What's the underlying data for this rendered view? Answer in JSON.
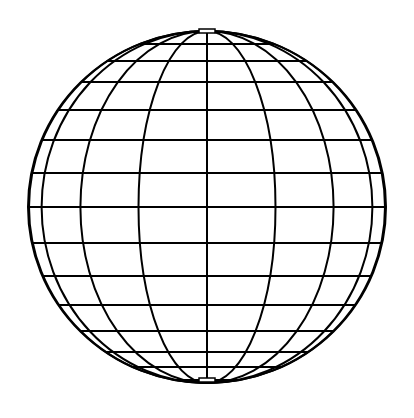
{
  "diagram": {
    "title": "Wireframe globe",
    "type": "sphere-graticule",
    "canvas": {
      "width": 414,
      "height": 418,
      "background": "#ffffff"
    },
    "stroke_color": "#000000",
    "stroke_width": 2,
    "globe": {
      "cx": 207,
      "cy": 207,
      "rx": 179,
      "ry": 176
    },
    "meridians_deg": [
      0,
      22.5,
      45,
      67.5,
      84
    ],
    "parallels_y": [
      32,
      44,
      61,
      82,
      110,
      140,
      173,
      207,
      243,
      276,
      305,
      331,
      352,
      367,
      380
    ],
    "pole_caps": [
      {
        "name": "north-pole-cap",
        "x": 199,
        "y": 29,
        "w": 16,
        "h": 4
      },
      {
        "name": "south-pole-cap",
        "x": 199,
        "y": 378,
        "w": 16,
        "h": 4
      }
    ]
  }
}
